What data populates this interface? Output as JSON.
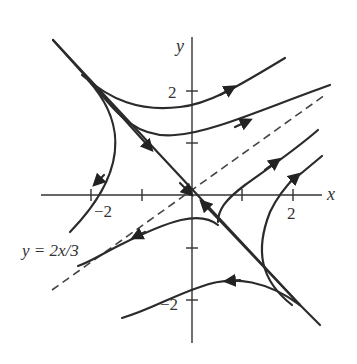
{
  "figure": {
    "type": "phase-portrait",
    "axes": {
      "x_label": "x",
      "y_label": "y",
      "x_ticks": [
        -2,
        -1,
        1,
        2
      ],
      "y_ticks": [
        -2,
        -1,
        1,
        2
      ],
      "x_tick_labels": [
        "−2",
        "2"
      ],
      "y_tick_labels": [
        "2",
        "−2"
      ]
    },
    "dashed_line_label": "y = 2x/3",
    "colors": {
      "curve": "#2b2b2b",
      "axis": "#333333"
    }
  }
}
